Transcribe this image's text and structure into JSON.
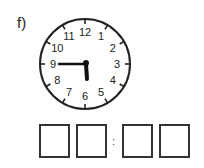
{
  "exercise": {
    "label": "f)",
    "clock": {
      "numbers": [
        "12",
        "1",
        "2",
        "3",
        "4",
        "5",
        "6",
        "7",
        "8",
        "9",
        "10",
        "11"
      ],
      "hour_hand_angle_deg": 172,
      "minute_hand_angle_deg": 270,
      "displayed_time": "5:45"
    },
    "answer": {
      "separator": ":",
      "boxes": [
        "",
        "",
        "",
        ""
      ]
    }
  }
}
